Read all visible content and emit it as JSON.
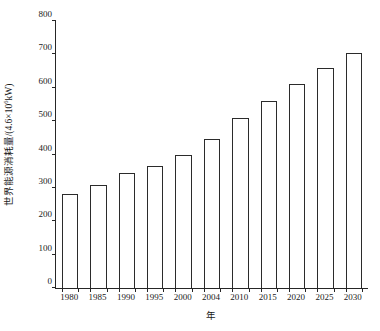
{
  "chart_data": {
    "type": "bar",
    "title": "",
    "subtitle": "",
    "xlabel": "年",
    "ylabel_prefix": "世界能源消耗量/(4.6×10",
    "ylabel_sup": "6",
    "ylabel_suffix": "kW)",
    "ylabel_full": "世界能源消耗量/(4.6×10⁶kW)",
    "categories": [
      "1980",
      "1985",
      "1990",
      "1995",
      "2000",
      "2004",
      "2010",
      "2015",
      "2020",
      "2025",
      "2030"
    ],
    "values": [
      281,
      308,
      345,
      366,
      400,
      445,
      510,
      560,
      610,
      658,
      705
    ],
    "ylim": [
      0,
      800
    ],
    "ytick_values": [
      0,
      100,
      200,
      300,
      400,
      500,
      600,
      700,
      800
    ],
    "ytick_labels": [
      "0",
      "100",
      "200",
      "300",
      "400",
      "500",
      "600",
      "700",
      "800"
    ],
    "grid": false,
    "legend": null,
    "legend_position": "none",
    "bar_fill_color": "#ffffff",
    "bar_edge_color": "#2b2b2b",
    "axis_color": "#262626",
    "background_color": "#ffffff"
  }
}
